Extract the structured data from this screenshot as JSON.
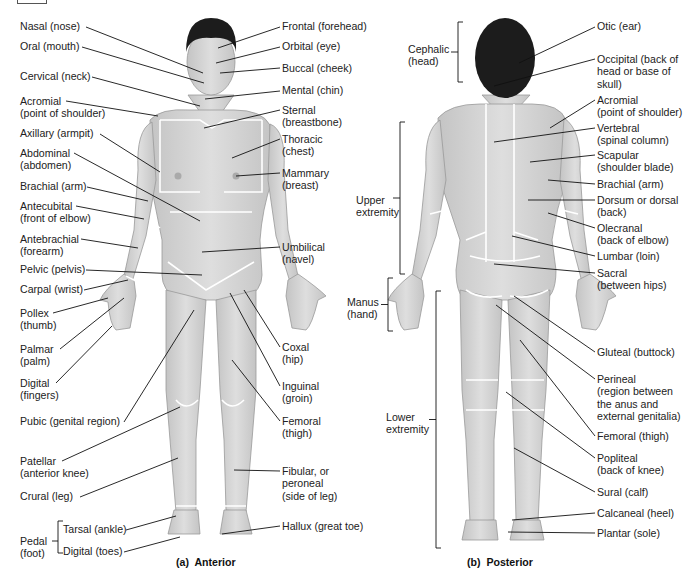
{
  "figure": {
    "anterior_caption": "(a)  Anterior",
    "posterior_caption": "(b)  Posterior"
  },
  "anterior": {
    "left_labels": [
      {
        "id": "nasal",
        "text": "Nasal (nose)",
        "x": 20,
        "y": 20,
        "line": [
          86,
          27,
          203,
          73
        ]
      },
      {
        "id": "oral",
        "text": "Oral (mouth)",
        "x": 20,
        "y": 40,
        "line": [
          82,
          47,
          204,
          83
        ]
      },
      {
        "id": "cervical",
        "text": "Cervical (neck)",
        "x": 20,
        "y": 70,
        "line": [
          92,
          77,
          200,
          106
        ]
      },
      {
        "id": "acromial",
        "text": "Acromial\n(point of shoulder)",
        "x": 20,
        "y": 95,
        "line": [
          66,
          101,
          158,
          116
        ]
      },
      {
        "id": "axillary",
        "text": "Axillary (armpit)",
        "x": 20,
        "y": 127,
        "line": [
          100,
          134,
          160,
          172
        ]
      },
      {
        "id": "abdominal",
        "text": "Abdominal\n(abdomen)",
        "x": 20,
        "y": 147,
        "line": [
          74,
          153,
          200,
          221
        ]
      },
      {
        "id": "brachial",
        "text": "Brachial (arm)",
        "x": 20,
        "y": 180,
        "line": [
          87,
          187,
          148,
          201
        ]
      },
      {
        "id": "antecubital",
        "text": "Antecubital\n(front of elbow)",
        "x": 20,
        "y": 200,
        "line": [
          76,
          206,
          144,
          219
        ]
      },
      {
        "id": "antebrachial",
        "text": "Antebrachial\n(forearm)",
        "x": 20,
        "y": 233,
        "line": [
          81,
          239,
          138,
          248
        ]
      },
      {
        "id": "pelvic",
        "text": "Pelvic (pelvis)",
        "x": 20,
        "y": 263,
        "line": [
          86,
          270,
          202,
          275
        ]
      },
      {
        "id": "carpal",
        "text": "Carpal (wrist)",
        "x": 20,
        "y": 283,
        "line": [
          84,
          290,
          128,
          280
        ]
      },
      {
        "id": "pollex",
        "text": "Pollex\n(thumb)",
        "x": 20,
        "y": 307,
        "line": [
          53,
          313,
          108,
          298
        ]
      },
      {
        "id": "palmar",
        "text": "Palmar\n(palm)",
        "x": 20,
        "y": 343,
        "line": [
          60,
          349,
          124,
          298
        ]
      },
      {
        "id": "digital_fingers",
        "text": "Digital\n(fingers)",
        "x": 20,
        "y": 377,
        "line": [
          56,
          383,
          112,
          326
        ]
      },
      {
        "id": "pubic",
        "text": "Pubic (genital region)",
        "x": 20,
        "y": 415,
        "line": [
          124,
          422,
          194,
          310
        ]
      },
      {
        "id": "patellar",
        "text": "Patellar\n(anterior knee)",
        "x": 20,
        "y": 455,
        "line": [
          62,
          461,
          180,
          407
        ]
      },
      {
        "id": "crural",
        "text": "Crural (leg)",
        "x": 20,
        "y": 490,
        "line": [
          80,
          497,
          178,
          458
        ]
      }
    ],
    "pedal_group": {
      "label": "Pedal\n(foot)",
      "x": 20,
      "y": 535,
      "items": [
        {
          "id": "tarsal",
          "text": "Tarsal (ankle)",
          "x": 63,
          "y": 523,
          "line": [
            126,
            530,
            176,
            516
          ]
        },
        {
          "id": "digital_toes",
          "text": "Digital (toes)",
          "x": 63,
          "y": 545,
          "line": [
            124,
            552,
            180,
            537
          ]
        }
      ]
    },
    "right_labels": [
      {
        "id": "frontal",
        "text": "Frontal (forehead)",
        "x": 282,
        "y": 20,
        "line": [
          280,
          27,
          218,
          48
        ]
      },
      {
        "id": "orbital",
        "text": "Orbital (eye)",
        "x": 282,
        "y": 40,
        "line": [
          280,
          47,
          216,
          63
        ]
      },
      {
        "id": "buccal",
        "text": "Buccal (cheek)",
        "x": 282,
        "y": 62,
        "line": [
          280,
          68,
          220,
          73
        ]
      },
      {
        "id": "mental",
        "text": "Mental (chin)",
        "x": 282,
        "y": 84,
        "line": [
          280,
          91,
          205,
          99
        ]
      },
      {
        "id": "sternal",
        "text": "Sternal\n(breastbone)",
        "x": 282,
        "y": 104,
        "line": [
          280,
          110,
          204,
          128
        ]
      },
      {
        "id": "thoracic",
        "text": "Thoracic\n(chest)",
        "x": 282,
        "y": 133,
        "line": [
          280,
          139,
          232,
          158
        ]
      },
      {
        "id": "mammary",
        "text": "Mammary\n(breast)",
        "x": 282,
        "y": 167,
        "line": [
          280,
          173,
          236,
          176
        ]
      },
      {
        "id": "umbilical",
        "text": "Umbilical\n(navel)",
        "x": 282,
        "y": 241,
        "line": [
          280,
          247,
          202,
          252
        ]
      },
      {
        "id": "coxal",
        "text": "Coxal\n(hip)",
        "x": 282,
        "y": 341,
        "line": [
          280,
          347,
          244,
          290
        ]
      },
      {
        "id": "inguinal",
        "text": "Inguinal\n(groin)",
        "x": 282,
        "y": 380,
        "line": [
          280,
          386,
          230,
          293
        ]
      },
      {
        "id": "femoral",
        "text": "Femoral\n(thigh)",
        "x": 282,
        "y": 415,
        "line": [
          280,
          421,
          232,
          360
        ]
      },
      {
        "id": "fibular",
        "text": "Fibular, or\nperoneal\n(side of leg)",
        "x": 282,
        "y": 465,
        "line": [
          280,
          471,
          234,
          470
        ]
      },
      {
        "id": "hallux",
        "text": "Hallux (great toe)",
        "x": 282,
        "y": 520,
        "line": [
          280,
          526,
          222,
          534
        ]
      }
    ]
  },
  "posterior": {
    "left_groups": [
      {
        "id": "cephalic",
        "text": "Cephalic\n(head)",
        "x": 408,
        "y": 43,
        "bracket": [
          458,
          22,
          82
        ]
      },
      {
        "id": "upper_extremity",
        "text": "Upper\nextremity",
        "x": 356,
        "y": 194,
        "bracket": [
          400,
          122,
          274
        ]
      },
      {
        "id": "manus",
        "text": "Manus\n(hand)",
        "x": 347,
        "y": 296,
        "bracket": [
          388,
          278,
          331
        ]
      },
      {
        "id": "lower_extremity",
        "text": "Lower\nextremity",
        "x": 386,
        "y": 411,
        "bracket": [
          436,
          291,
          548
        ]
      }
    ],
    "right_labels": [
      {
        "id": "otic",
        "text": "Otic (ear)",
        "x": 597,
        "y": 20,
        "line": [
          595,
          27,
          519,
          63
        ]
      },
      {
        "id": "occipital",
        "text": "Occipital (back of\nhead or base of\nskull)",
        "x": 597,
        "y": 53,
        "line": [
          595,
          59,
          494,
          86
        ]
      },
      {
        "id": "acromial_post",
        "text": "Acromial\n(point of shoulder)",
        "x": 597,
        "y": 94,
        "line": [
          595,
          100,
          550,
          128
        ]
      },
      {
        "id": "vertebral",
        "text": "Vertebral\n(spinal column)",
        "x": 597,
        "y": 122,
        "line": [
          595,
          128,
          494,
          142
        ]
      },
      {
        "id": "scapular",
        "text": "Scapular\n(shoulder blade)",
        "x": 597,
        "y": 149,
        "line": [
          595,
          155,
          530,
          162
        ]
      },
      {
        "id": "brachial_post",
        "text": "Brachial (arm)",
        "x": 597,
        "y": 178,
        "line": [
          595,
          184,
          548,
          180
        ]
      },
      {
        "id": "dorsum",
        "text": "Dorsum or dorsal\n(back)",
        "x": 597,
        "y": 194,
        "line": [
          595,
          200,
          528,
          200
        ]
      },
      {
        "id": "olecranal",
        "text": "Olecranal\n(back of elbow)",
        "x": 597,
        "y": 222,
        "line": [
          595,
          228,
          548,
          213
        ]
      },
      {
        "id": "lumbar",
        "text": "Lumbar (loin)",
        "x": 597,
        "y": 250,
        "line": [
          595,
          256,
          512,
          236
        ]
      },
      {
        "id": "sacral",
        "text": "Sacral\n(between hips)",
        "x": 597,
        "y": 267,
        "line": [
          595,
          273,
          494,
          264
        ]
      },
      {
        "id": "gluteal",
        "text": "Gluteal (buttock)",
        "x": 597,
        "y": 346,
        "line": [
          595,
          352,
          514,
          296
        ]
      },
      {
        "id": "perineal",
        "text": "Perineal\n(region between\nthe anus and\nexternal genitalia)",
        "x": 597,
        "y": 373,
        "line": [
          595,
          379,
          496,
          305
        ]
      },
      {
        "id": "femoral_post",
        "text": "Femoral (thigh)",
        "x": 597,
        "y": 430,
        "line": [
          595,
          436,
          520,
          340
        ]
      },
      {
        "id": "popliteal",
        "text": "Popliteal\n(back of knee)",
        "x": 597,
        "y": 452,
        "line": [
          595,
          458,
          506,
          392
        ]
      },
      {
        "id": "sural",
        "text": "Sural (calf)",
        "x": 597,
        "y": 486,
        "line": [
          595,
          492,
          514,
          448
        ]
      },
      {
        "id": "calcaneal",
        "text": "Calcaneal (heel)",
        "x": 597,
        "y": 507,
        "line": [
          595,
          513,
          512,
          520
        ]
      },
      {
        "id": "plantar",
        "text": "Plantar (sole)",
        "x": 597,
        "y": 527,
        "line": [
          595,
          533,
          508,
          532
        ]
      }
    ]
  },
  "colors": {
    "skin": "#d6d6d6",
    "skin_shade": "#bcbcbc",
    "hair": "#1c1c1c",
    "line": "#111111",
    "region_border": "#ffffff",
    "text": "#222222"
  }
}
